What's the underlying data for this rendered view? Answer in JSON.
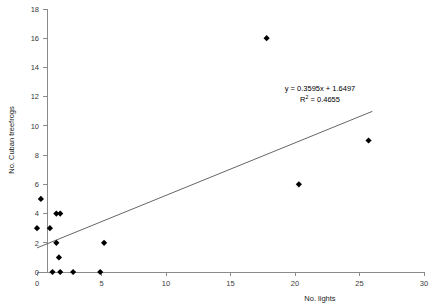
{
  "chart_data": {
    "type": "scatter",
    "title": "",
    "xlabel": "No. lights",
    "ylabel": "No. Cuban treefrogs",
    "xlim": [
      0,
      30
    ],
    "ylim": [
      0,
      18
    ],
    "xticks": [
      0,
      5,
      10,
      15,
      20,
      25,
      30
    ],
    "yticks": [
      0,
      2,
      4,
      6,
      8,
      10,
      12,
      14,
      16,
      18
    ],
    "grid": false,
    "legend": null,
    "series": [
      {
        "name": "Cuban treefrogs vs lights",
        "marker": "diamond",
        "color": "#000000",
        "points": [
          {
            "x": 0.0,
            "y": 3
          },
          {
            "x": 0.3,
            "y": 5
          },
          {
            "x": 1.0,
            "y": 3
          },
          {
            "x": 1.2,
            "y": 0
          },
          {
            "x": 1.5,
            "y": 2
          },
          {
            "x": 1.5,
            "y": 4
          },
          {
            "x": 1.8,
            "y": 4
          },
          {
            "x": 1.8,
            "y": 0
          },
          {
            "x": 1.7,
            "y": 1
          },
          {
            "x": 2.8,
            "y": 0
          },
          {
            "x": 4.9,
            "y": 0
          },
          {
            "x": 5.2,
            "y": 2
          },
          {
            "x": 17.8,
            "y": 16
          },
          {
            "x": 20.3,
            "y": 6
          },
          {
            "x": 25.7,
            "y": 9
          }
        ]
      }
    ],
    "trendline": {
      "type": "linear",
      "slope": 0.3595,
      "intercept": 1.6497,
      "r_squared": 0.4655,
      "x_start": 0,
      "x_end": 26
    },
    "annotations": {
      "equation": "y = 0.3595x + 1.6497",
      "r_squared_prefix": "R",
      "r_squared_sup": "2",
      "r_squared_value": " = 0.4655"
    }
  }
}
